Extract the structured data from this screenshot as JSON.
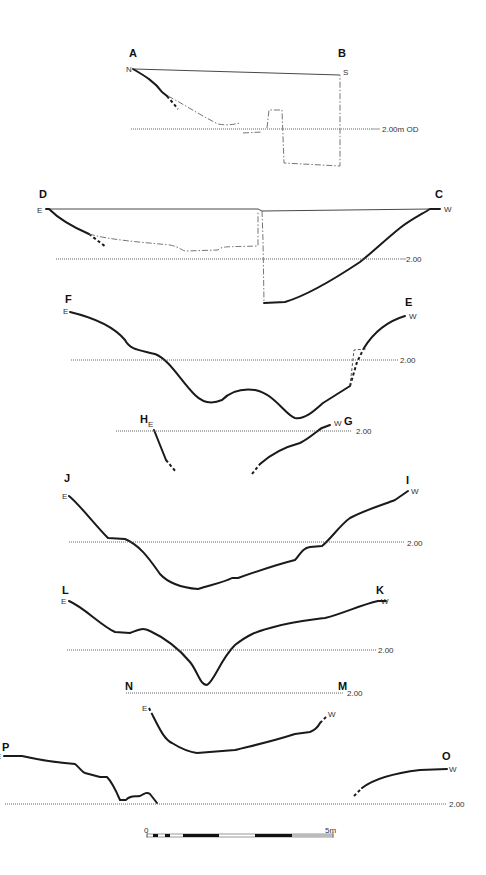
{
  "figure": {
    "type": "archaeological-section-profiles",
    "datum_label_first": "2.00m OD",
    "datum_label": "2.00",
    "sections": [
      {
        "id": "A-B",
        "start_label": "A",
        "end_label": "B",
        "start_dir": "N",
        "end_dir": "S",
        "datum": "2.00m OD"
      },
      {
        "id": "D-C",
        "start_label": "D",
        "end_label": "C",
        "start_dir": "E",
        "end_dir": "W",
        "datum": "2.00"
      },
      {
        "id": "F-E",
        "start_label": "F",
        "end_label": "E",
        "start_dir": "E",
        "end_dir": "W",
        "datum": "2.00"
      },
      {
        "id": "H-G",
        "start_label": "H",
        "end_label": "G",
        "start_dir": "E",
        "end_dir": "W",
        "datum": "2.00"
      },
      {
        "id": "J-I",
        "start_label": "J",
        "end_label": "I",
        "start_dir": "E",
        "end_dir": "W",
        "datum": "2.00"
      },
      {
        "id": "L-K",
        "start_label": "L",
        "end_label": "K",
        "start_dir": "E",
        "end_dir": "W",
        "datum": "2.00"
      },
      {
        "id": "N-M",
        "start_label": "N",
        "end_label": "M",
        "start_dir": "E",
        "end_dir": "W",
        "datum": "2.00"
      },
      {
        "id": "P-O",
        "start_label": "P",
        "end_label": "O",
        "start_dir": "E",
        "end_dir": "W",
        "datum": "2.00"
      }
    ],
    "scale_bar": {
      "start_label": "0",
      "end_label": "5m"
    }
  }
}
